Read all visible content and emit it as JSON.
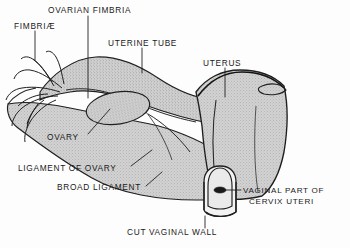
{
  "figure": {
    "style": "vintage line engraving with stipple shading",
    "colors": {
      "background": "#fdfdfd",
      "ink": "#1a1a1a",
      "organ_fill": "#c9c9c9",
      "organ_fill_light": "#d6d6d6",
      "leader_line": "#2a2a2a"
    }
  },
  "labels": [
    {
      "id": "fimbriae",
      "text": "FIMBRIÆ",
      "x": 14,
      "y": 26,
      "leader": "vertical-down"
    },
    {
      "id": "ovarian-fimbria",
      "text": "OVARIAN FIMBRIA",
      "x": 78,
      "y": 9,
      "leader": "vertical-down"
    },
    {
      "id": "uterine-tube",
      "text": "UTERINE TUBE",
      "x": 136,
      "y": 42,
      "leader": "vertical-down"
    },
    {
      "id": "uterus",
      "text": "UTERUS",
      "x": 207,
      "y": 62,
      "leader": "vertical-down"
    },
    {
      "id": "ovary",
      "text": "OVARY",
      "x": 53,
      "y": 136,
      "leader": "diagonal-up-right"
    },
    {
      "id": "ligament-of-ovary",
      "text": "LIGAMENT OF OVARY",
      "x": 18,
      "y": 168,
      "leader": "diagonal-up-right"
    },
    {
      "id": "broad-ligament",
      "text": "BROAD LIGAMENT",
      "x": 58,
      "y": 187,
      "leader": "diagonal-up-right"
    },
    {
      "id": "vaginal-part-of-cervix-uteri",
      "line1": "VAGINAL PART  OF",
      "line2": "CERVIX  UTERI",
      "x": 243,
      "y": 190,
      "leader": "horizontal-left"
    },
    {
      "id": "cut-vaginal-wall",
      "text": "CUT VAGINAL WALL",
      "x": 127,
      "y": 231,
      "leader": "vertical-up"
    }
  ],
  "structures": [
    {
      "id": "fimbriae-fringe",
      "name": "fimbriae of uterine tube"
    },
    {
      "id": "ovarian-fimbria-strand",
      "name": "ovarian fimbria"
    },
    {
      "id": "uterine-tube-body",
      "name": "uterine tube"
    },
    {
      "id": "ovary-body",
      "name": "ovary"
    },
    {
      "id": "uterus-body",
      "name": "uterus"
    },
    {
      "id": "broad-ligament-sheet",
      "name": "broad ligament"
    },
    {
      "id": "ligament-of-ovary-cord",
      "name": "ligament of ovary"
    },
    {
      "id": "cervix-dome",
      "name": "vaginal part of cervix uteri"
    },
    {
      "id": "external-os",
      "name": "external os of uterus"
    },
    {
      "id": "cut-vaginal-wall-cuff",
      "name": "cut vaginal wall"
    }
  ]
}
